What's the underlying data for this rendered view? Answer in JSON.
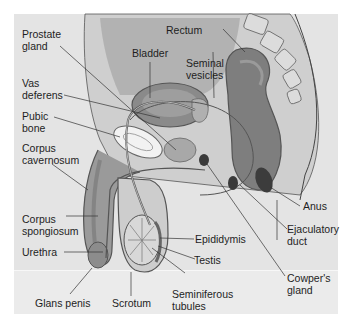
{
  "diagram": {
    "type": "anatomical-cross-section",
    "colors": {
      "background": "#e4e4e4",
      "tissue_dark": "#7a7a7a",
      "tissue_mid": "#a6a6a6",
      "tissue_light": "#d2d2d2",
      "bone": "#f2f2f2",
      "line": "#3a3a3a",
      "text": "#1e1e1e"
    },
    "labels": [
      {
        "id": "prostate-gland",
        "line1": "Prostate",
        "line2": "gland"
      },
      {
        "id": "bladder",
        "line1": "Bladder",
        "line2": ""
      },
      {
        "id": "rectum",
        "line1": "Rectum",
        "line2": ""
      },
      {
        "id": "seminal-vesicles",
        "line1": "Seminal",
        "line2": "vesicles"
      },
      {
        "id": "vas-deferens",
        "line1": "Vas",
        "line2": "deferens"
      },
      {
        "id": "pubic-bone",
        "line1": "Pubic",
        "line2": "bone"
      },
      {
        "id": "corpus-cavernosum",
        "line1": "Corpus",
        "line2": "cavernosum"
      },
      {
        "id": "corpus-spongiosum",
        "line1": "Corpus",
        "line2": "spongiosum"
      },
      {
        "id": "urethra",
        "line1": "Urethra",
        "line2": ""
      },
      {
        "id": "glans-penis",
        "line1": "Glans penis",
        "line2": ""
      },
      {
        "id": "scrotum",
        "line1": "Scrotum",
        "line2": ""
      },
      {
        "id": "seminiferous-tubules",
        "line1": "Seminiferous",
        "line2": "tubules"
      },
      {
        "id": "testis",
        "line1": "Testis",
        "line2": ""
      },
      {
        "id": "epididymis",
        "line1": "Epididymis",
        "line2": ""
      },
      {
        "id": "cowpers-gland",
        "line1": "Cowper's",
        "line2": "gland"
      },
      {
        "id": "ejaculatory-duct",
        "line1": "Ejaculatory",
        "line2": "duct"
      },
      {
        "id": "anus",
        "line1": "Anus",
        "line2": ""
      }
    ]
  }
}
